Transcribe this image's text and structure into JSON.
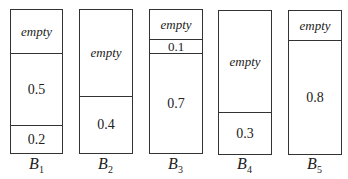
{
  "bins": [
    {
      "name": "B",
      "sub": "1",
      "segments": [
        {
          "label": "empty",
          "size": 0.3
        },
        {
          "label": "0.5",
          "size": 0.5
        },
        {
          "label": "0.2",
          "size": 0.2
        }
      ]
    },
    {
      "name": "B",
      "sub": "2",
      "segments": [
        {
          "label": "empty",
          "size": 0.6
        },
        {
          "label": "0.4",
          "size": 0.4
        }
      ]
    },
    {
      "name": "B",
      "sub": "3",
      "segments": [
        {
          "label": "empty",
          "size": 0.2
        },
        {
          "label": "0.1",
          "size": 0.1
        },
        {
          "label": "0.7",
          "size": 0.7
        }
      ]
    },
    {
      "name": "B",
      "sub": "4",
      "segments": [
        {
          "label": "empty",
          "size": 0.7
        },
        {
          "label": "0.3",
          "size": 0.3
        }
      ]
    },
    {
      "name": "B",
      "sub": "5",
      "segments": [
        {
          "label": "empty",
          "size": 0.2
        },
        {
          "label": "0.8",
          "size": 0.8
        }
      ]
    }
  ]
}
